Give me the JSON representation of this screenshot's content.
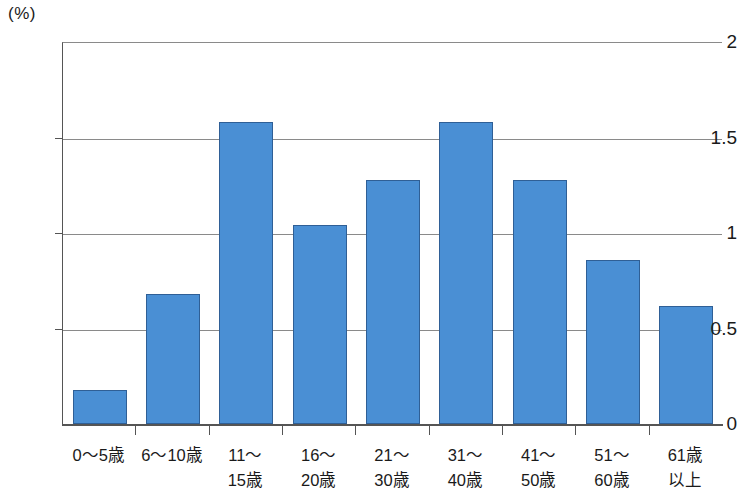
{
  "chart_data": {
    "type": "bar",
    "title": "",
    "subtitle": "",
    "xlabel": "",
    "ylabel": "(%)",
    "unit_label": "(%)",
    "categories": [
      "0〜5歳",
      "6〜10歳",
      "11〜\n15歳",
      "16〜\n20歳",
      "21〜\n30歳",
      "31〜\n40歳",
      "41〜\n50歳",
      "51〜\n60歳",
      "61歳\n以上"
    ],
    "category_lines": [
      [
        "0〜5歳",
        ""
      ],
      [
        "6〜10歳",
        ""
      ],
      [
        "11〜",
        "15歳"
      ],
      [
        "16〜",
        "20歳"
      ],
      [
        "21〜",
        "30歳"
      ],
      [
        "31〜",
        "40歳"
      ],
      [
        "41〜",
        "50歳"
      ],
      [
        "51〜",
        "60歳"
      ],
      [
        "61歳",
        "以上"
      ]
    ],
    "values": [
      0.18,
      0.68,
      1.58,
      1.04,
      1.28,
      1.58,
      1.28,
      0.86,
      0.62
    ],
    "ylim": [
      0,
      2
    ],
    "ytick_values": [
      0,
      0.5,
      1,
      1.5,
      2
    ],
    "ytick_labels": [
      "0",
      "0.5",
      "1",
      "1.5",
      "2"
    ],
    "grid": true,
    "grid_orientation": "horizontal",
    "legend": "none",
    "legend_position": "none",
    "bar_color": "#4a8fd4",
    "bar_border_color": "#2f5f96",
    "axis_color": "#555555",
    "grid_color": "#8a8a8a",
    "background_color": "#ffffff"
  }
}
